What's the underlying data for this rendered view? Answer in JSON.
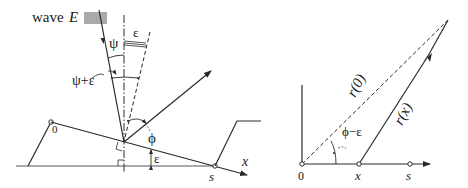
{
  "left_diagram": {
    "wave_label": "wave",
    "wave_symbol": "E",
    "psi_label": "ψ",
    "epsilon_top_label": "ε",
    "psi_plus_epsilon_label": "ψ+ε",
    "phi_label": "ϕ",
    "epsilon_bottom_label": "ε",
    "origin_label": "0",
    "s_label": "s",
    "x_axis_label": "x"
  },
  "right_diagram": {
    "r0_label": "r(0)",
    "rx_label": "r(x)",
    "phi_minus_epsilon_label": "ϕ−ε",
    "origin_label": "0",
    "x_label": "x",
    "s_label": "s"
  },
  "colors": {
    "line": "#2a2a2a",
    "text": "#1a1a1a",
    "background": "#ffffff"
  }
}
